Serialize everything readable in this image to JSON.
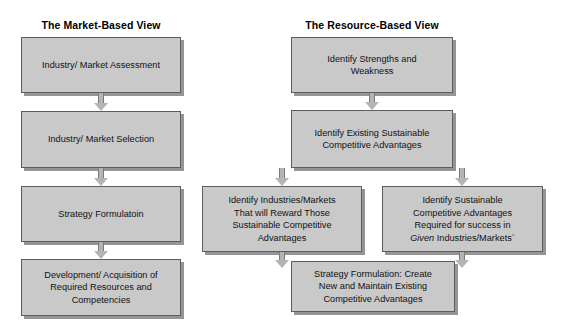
{
  "diagram": {
    "columns": [
      {
        "id": "market-based",
        "title": "The Market-Based View"
      },
      {
        "id": "resource-based",
        "title": "The Resource-Based View"
      }
    ],
    "nodes": {
      "mbv_1": "Industry/ Market Assessment",
      "mbv_2": "Industry/ Market Selection",
      "mbv_3": "Strategy Formulatoin",
      "mbv_4_line1": "Development/ Acquisition of",
      "mbv_4_line2": "Required Resources and",
      "mbv_4_line3": "Competencies",
      "rbv_1_line1": "Identify Strengths and",
      "rbv_1_line2": "Weakness",
      "rbv_2_line1": "Identify Existing Sustainable",
      "rbv_2_line2": "Competitive Advantages",
      "rbv_3a_line1": "Identify Industries/Markets",
      "rbv_3a_line2": "That will Reward Those",
      "rbv_3a_line3": "Sustainable Competitive",
      "rbv_3a_line4": "Advantages",
      "rbv_3b_line1": "Identify Sustainable",
      "rbv_3b_line2": "Competitive Advantages",
      "rbv_3b_line3": "Required for success in",
      "rbv_3b_line4_italic": "Given",
      "rbv_3b_line4_rest": " Industries/Markets`",
      "rbv_4_line1": "Strategy Formulation: Create",
      "rbv_4_line2": "New and Maintain Existing",
      "rbv_4_line3": "Competitive Advantages"
    },
    "colors": {
      "box_fill": "#c9c9c9",
      "box_border": "#5d5d5d",
      "arrow_fill": "#b4b4b4",
      "text": "#111111",
      "background": "#ffffff"
    }
  }
}
